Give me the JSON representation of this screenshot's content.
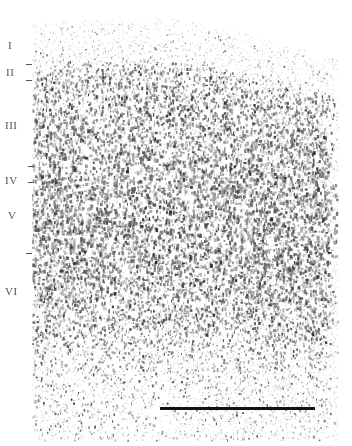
{
  "figure": {
    "type": "cortical-layer-histology-micrograph",
    "background": "#ffffff",
    "stain_color": "#2b2b2b",
    "layer_labels": [
      {
        "text": "I",
        "x": 8,
        "y": 40
      },
      {
        "text": "II",
        "x": 6,
        "y": 67
      },
      {
        "text": "III",
        "x": 5,
        "y": 120
      },
      {
        "text": "IV",
        "x": 5,
        "y": 175
      },
      {
        "text": "V",
        "x": 8,
        "y": 210
      },
      {
        "text": "VI",
        "x": 5,
        "y": 286
      }
    ],
    "boundary_ticks": [
      {
        "x": 26,
        "y": 64
      },
      {
        "x": 26,
        "y": 80
      },
      {
        "x": 28,
        "y": 166
      },
      {
        "x": 28,
        "y": 182
      },
      {
        "x": 26,
        "y": 253
      }
    ],
    "scale_bar": {
      "x1": 160,
      "x2": 315,
      "y": 407,
      "thickness": 3,
      "color": "#111111"
    },
    "tissue_bounds": {
      "left": 32,
      "right": 338,
      "bottom": 440
    },
    "pial_surface": [
      [
        32,
        28
      ],
      [
        80,
        24
      ],
      [
        130,
        22
      ],
      [
        160,
        20
      ],
      [
        200,
        28
      ],
      [
        240,
        36
      ],
      [
        280,
        48
      ],
      [
        320,
        58
      ],
      [
        338,
        62
      ]
    ],
    "density_profile": [
      {
        "depth": 0,
        "density": 0.08,
        "size": 0.8
      },
      {
        "depth": 0.08,
        "density": 0.1,
        "size": 0.9
      },
      {
        "depth": 0.11,
        "density": 0.55,
        "size": 1.3
      },
      {
        "depth": 0.2,
        "density": 0.5,
        "size": 1.5
      },
      {
        "depth": 0.35,
        "density": 0.55,
        "size": 1.7
      },
      {
        "depth": 0.42,
        "density": 0.65,
        "size": 1.6
      },
      {
        "depth": 0.52,
        "density": 0.55,
        "size": 1.7
      },
      {
        "depth": 0.62,
        "density": 0.6,
        "size": 1.5
      },
      {
        "depth": 0.74,
        "density": 0.45,
        "size": 1.3
      },
      {
        "depth": 0.85,
        "density": 0.22,
        "size": 1.1
      },
      {
        "depth": 1.0,
        "density": 0.15,
        "size": 1.0
      }
    ]
  }
}
